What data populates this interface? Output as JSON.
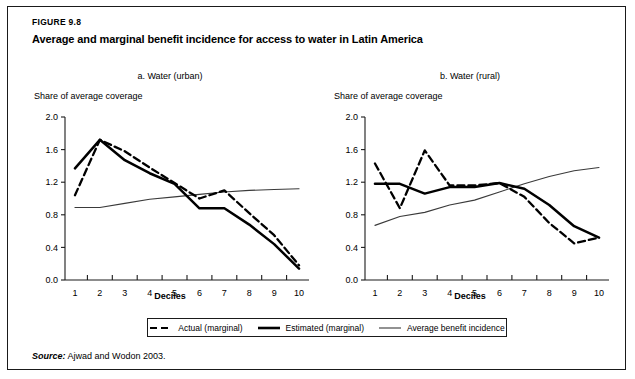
{
  "figure": {
    "number": "FIGURE 9.8",
    "title": "Average and marginal benefit incidence for access to water in Latin America",
    "source_label": "Source:",
    "source_text": "Ajwad and Wodon 2003."
  },
  "legend": {
    "items": [
      {
        "label": "Actual (marginal)",
        "style": "dashed",
        "color": "#000000",
        "width": 2.2
      },
      {
        "label": "Estimated (marginal)",
        "style": "solid",
        "color": "#000000",
        "width": 2.4
      },
      {
        "label": "Average benefit incidence",
        "style": "solid",
        "color": "#3a3a3a",
        "width": 1.1
      }
    ]
  },
  "chart_data": [
    {
      "type": "line",
      "panel": "a",
      "title": "a. Water (urban)",
      "xlabel": "Deciles",
      "ylabel": "Share of average coverage",
      "categories": [
        "1",
        "2",
        "3",
        "4",
        "5",
        "6",
        "7",
        "8",
        "9",
        "10"
      ],
      "x": [
        1,
        2,
        3,
        4,
        5,
        6,
        7,
        8,
        9,
        10
      ],
      "xlim": [
        0.6,
        10.4
      ],
      "ylim": [
        0.0,
        2.0
      ],
      "yticks": [
        0.0,
        0.4,
        0.8,
        1.2,
        1.6,
        2.0
      ],
      "yticklabels": [
        "0.0",
        "0.4",
        "0.8",
        "1.2",
        "1.6",
        "2.0"
      ],
      "grid": false,
      "legend_position": "below",
      "series": [
        {
          "name": "Actual (marginal)",
          "style": "dashed",
          "values": [
            1.04,
            1.72,
            1.58,
            1.38,
            1.19,
            1.0,
            1.1,
            0.82,
            0.55,
            0.18
          ]
        },
        {
          "name": "Estimated (marginal)",
          "style": "solid",
          "values": [
            1.37,
            1.72,
            1.47,
            1.31,
            1.18,
            0.88,
            0.88,
            0.68,
            0.44,
            0.14
          ]
        },
        {
          "name": "Average benefit incidence",
          "style": "thin",
          "values": [
            0.89,
            0.89,
            0.94,
            0.99,
            1.02,
            1.05,
            1.08,
            1.1,
            1.11,
            1.12
          ]
        }
      ]
    },
    {
      "type": "line",
      "panel": "b",
      "title": "b. Water (rural)",
      "xlabel": "Deciles",
      "ylabel": "Share of average coverage",
      "categories": [
        "1",
        "2",
        "3",
        "4",
        "5",
        "6",
        "7",
        "8",
        "9",
        "10"
      ],
      "x": [
        1,
        2,
        3,
        4,
        5,
        6,
        7,
        8,
        9,
        10
      ],
      "xlim": [
        0.6,
        10.4
      ],
      "ylim": [
        0.0,
        2.0
      ],
      "yticks": [
        0.0,
        0.4,
        0.8,
        1.2,
        1.6,
        2.0
      ],
      "yticklabels": [
        "0.0",
        "0.4",
        "0.8",
        "1.2",
        "1.6",
        "2.0"
      ],
      "grid": false,
      "legend_position": "below",
      "series": [
        {
          "name": "Actual (marginal)",
          "style": "dashed",
          "values": [
            1.43,
            0.88,
            1.59,
            1.16,
            1.16,
            1.19,
            1.02,
            0.7,
            0.45,
            0.52
          ]
        },
        {
          "name": "Estimated (marginal)",
          "style": "solid",
          "values": [
            1.18,
            1.18,
            1.06,
            1.14,
            1.14,
            1.19,
            1.12,
            0.92,
            0.66,
            0.52
          ]
        },
        {
          "name": "Average benefit incidence",
          "style": "thin",
          "values": [
            0.67,
            0.78,
            0.83,
            0.92,
            0.98,
            1.08,
            1.18,
            1.27,
            1.34,
            1.38
          ]
        }
      ]
    }
  ]
}
